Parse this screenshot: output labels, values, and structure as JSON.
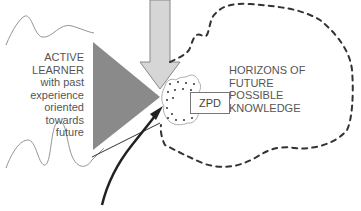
{
  "learner": {
    "lines": [
      "ACTIVE",
      "LEARNER",
      "with past",
      "experience",
      "oriented",
      "towards",
      "future"
    ]
  },
  "horizons": {
    "lines": [
      "HORIZONS OF",
      "FUTURE",
      "POSSIBLE",
      "KNOWLEDGE"
    ]
  },
  "zpd": {
    "label": "ZPD"
  },
  "colors": {
    "cone": "#8a8a8a",
    "down_arrow_fill": "#d4d4d4",
    "down_arrow_stroke": "#888888",
    "dashed_boundary": "#333333",
    "text": "#555555"
  }
}
